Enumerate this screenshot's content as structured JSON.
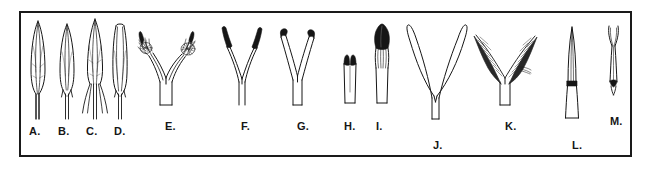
{
  "figure": {
    "kind": "botanical-line-drawing-plate",
    "border_color": "#1a1a1a",
    "ink_color": "#161616",
    "background_color": "#ffffff",
    "panel_count": 13
  },
  "specimens": [
    {
      "id": "A",
      "label": "A.",
      "label_x": 29,
      "label_y": 126,
      "x": 26,
      "y": 20,
      "type": "anther-lanceolate-entire",
      "description": "narrow lanceolate anther on slender filament, pointed apex, entire base"
    },
    {
      "id": "B",
      "label": "B.",
      "label_x": 58,
      "label_y": 126,
      "x": 55,
      "y": 22,
      "type": "anther-shortly-bifid-base",
      "description": "lanceolate anther with short forked base on slender filament"
    },
    {
      "id": "C",
      "label": "C.",
      "label_x": 86,
      "label_y": 126,
      "x": 81,
      "y": 18,
      "type": "anther-deeply-bifid-base",
      "description": "slender anther with long spreading deeply divided base lobes"
    },
    {
      "id": "D",
      "label": "D.",
      "label_x": 114,
      "label_y": 126,
      "x": 108,
      "y": 21,
      "type": "anther-blunt-apex",
      "description": "narrow anther with truncate blunt apex and short bifid base"
    },
    {
      "id": "E",
      "label": "E.",
      "label_x": 165,
      "label_y": 121,
      "x": 133,
      "y": 20,
      "type": "style-two-branched-plumose-stigma",
      "description": "two-branched style with dense tufted plumose stigmas at tips"
    },
    {
      "id": "F",
      "label": "F.",
      "label_x": 241,
      "label_y": 121,
      "x": 216,
      "y": 22,
      "type": "style-v-shaped-dark-elongate-stigma",
      "description": "narrow V-shaped style with long dark straight stigma branches"
    },
    {
      "id": "G",
      "label": "G.",
      "label_x": 297,
      "label_y": 121,
      "x": 270,
      "y": 24,
      "type": "style-y-shaped-hooked-stigma",
      "description": "Y-shaped style with short dark hooked recurved stigma tips"
    },
    {
      "id": "H",
      "label": "H.",
      "label_x": 344,
      "label_y": 121,
      "x": 340,
      "y": 52,
      "type": "style-short-sessile-dark-stigma",
      "description": "short broad tube with two small dark sessile stigma lobes"
    },
    {
      "id": "I",
      "label": "I.",
      "label_x": 376,
      "label_y": 121,
      "x": 370,
      "y": 22,
      "type": "style-clavate-dark-capitate-stigma",
      "description": "erect column with large dark clavate capitate stigma head"
    },
    {
      "id": "J",
      "label": "J.",
      "label_x": 433,
      "label_y": 140,
      "x": 404,
      "y": 20,
      "type": "style-long-glabrous-forked",
      "description": "tall widely forked style with long smooth glabrous branches"
    },
    {
      "id": "K",
      "label": "K.",
      "label_x": 505,
      "label_y": 121,
      "x": 468,
      "y": 24,
      "type": "style-plumose-feathery-branches",
      "description": "forked style with broad dark feathery plumose stigma branches"
    },
    {
      "id": "L",
      "label": "L.",
      "label_x": 572,
      "label_y": 140,
      "x": 563,
      "y": 24,
      "type": "lemma-awn-with-dark-node",
      "description": "slender elongate body with dark transverse node band near middle"
    },
    {
      "id": "M",
      "label": "M.",
      "label_x": 610,
      "label_y": 116,
      "x": 604,
      "y": 24,
      "type": "bifid-lemma-with-dark-base-node",
      "description": "slender bifid-tipped body with small dark node near the base"
    }
  ]
}
